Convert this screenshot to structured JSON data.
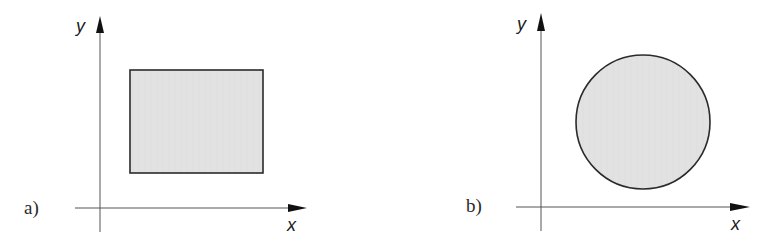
{
  "panels": [
    {
      "label": "a)",
      "x_axis_label": "x",
      "y_axis_label": "y",
      "shape": "rectangle",
      "fill_color": "#e3e3e3",
      "stroke_color": "#2b2b2b"
    },
    {
      "label": "b)",
      "x_axis_label": "x",
      "y_axis_label": "y",
      "shape": "circle",
      "fill_color": "#e3e3e3",
      "stroke_color": "#2b2b2b"
    }
  ]
}
